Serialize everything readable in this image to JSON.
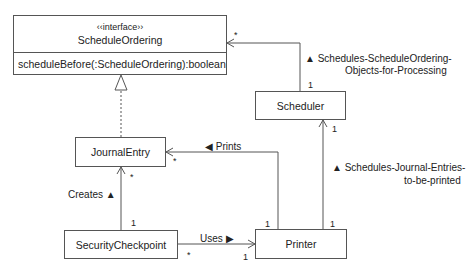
{
  "interface": {
    "stereotype": "‹‹interface››",
    "name": "ScheduleOrdering",
    "operation": "scheduleBefore(:ScheduleOrdering):boolean"
  },
  "classes": {
    "scheduler": "Scheduler",
    "journal_entry": "JournalEntry",
    "security_checkpoint": "SecurityCheckpoint",
    "printer": "Printer"
  },
  "associations": {
    "schedules_ordering": {
      "label_line1": "▲ Schedules-ScheduleOrdering-",
      "label_line2": "Objects-for-Processing",
      "mult_target": "*",
      "mult_source": "1"
    },
    "prints": {
      "label": "◀ Prints",
      "mult_target": "*",
      "mult_source": "1"
    },
    "schedules_journal": {
      "label_line1": "▲ Schedules-Journal-Entries-",
      "label_line2": "to-be-printed",
      "mult_target": "1",
      "mult_source": "1"
    },
    "creates": {
      "label": "Creates ▲",
      "mult_target": "*",
      "mult_source": "1"
    },
    "uses": {
      "label": "Uses ▶",
      "mult_target": "1",
      "mult_source": "*"
    }
  }
}
